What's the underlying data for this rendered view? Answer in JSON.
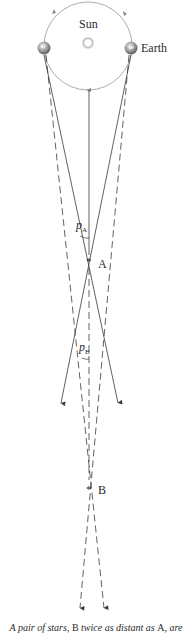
{
  "labels": {
    "sun": "Sun",
    "earth": "Earth",
    "star_a": "A",
    "star_b": "B",
    "star_marker": "*",
    "parallax_a_symbol": "p",
    "parallax_a_sub": "A",
    "parallax_b_symbol": "p",
    "parallax_b_sub": "B"
  },
  "caption": {
    "part1": "A pair of stars, ",
    "b": "B",
    "part2": " twice as distant as ",
    "a": "A",
    "part3": ", are"
  },
  "colors": {
    "line": "#3a3a3a",
    "orbit": "#8a8a8a",
    "sun_glow": "#c8c8c8"
  }
}
